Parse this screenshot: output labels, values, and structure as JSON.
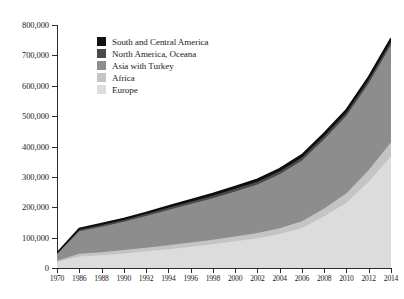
{
  "chart_data": {
    "type": "area",
    "stacked": true,
    "title": "",
    "xlabel": "",
    "ylabel": "",
    "grid": false,
    "legend_position": "inside-top-left",
    "x": [
      1970,
      1986,
      1988,
      1990,
      1992,
      1994,
      1996,
      1998,
      2000,
      2002,
      2004,
      2006,
      2008,
      2010,
      2012,
      2014
    ],
    "xtick_labels": [
      "1970",
      "1986",
      "1988",
      "1990",
      "1992",
      "1994",
      "1996",
      "1998",
      "2000",
      "2002",
      "2004",
      "2006",
      "2008",
      "2010",
      "2012",
      "2014"
    ],
    "xlim": [
      1970,
      2014
    ],
    "ylim": [
      0,
      800000
    ],
    "ytick_values": [
      0,
      100000,
      200000,
      300000,
      400000,
      500000,
      600000,
      700000,
      800000
    ],
    "ytick_labels": [
      "0",
      "100,000",
      "200,000",
      "300,000",
      "400,000",
      "500,000",
      "600,000",
      "700,000",
      "800,000"
    ],
    "series": [
      {
        "name": "Europe",
        "color": "#dcdcdc",
        "values": [
          20000,
          38000,
          42000,
          48000,
          55000,
          62000,
          70000,
          78000,
          88000,
          98000,
          112000,
          132000,
          170000,
          215000,
          285000,
          368000
        ]
      },
      {
        "name": "Africa",
        "color": "#c4c4c4",
        "values": [
          4000,
          9000,
          10000,
          11000,
          12000,
          13000,
          14000,
          15000,
          16000,
          17000,
          19000,
          22000,
          26000,
          31000,
          38000,
          46000
        ]
      },
      {
        "name": "Asia with Turkey",
        "color": "#8d8d8d",
        "values": [
          22000,
          74000,
          84000,
          93000,
          104000,
          116000,
          127000,
          137000,
          148000,
          160000,
          178000,
          200000,
          228000,
          255000,
          285000,
          320000
        ]
      },
      {
        "name": "North America, Oceana",
        "color": "#4a4a4a",
        "values": [
          2000,
          5000,
          5500,
          6000,
          6500,
          7000,
          7500,
          8000,
          8500,
          9000,
          9500,
          10000,
          10500,
          11000,
          11500,
          12000
        ]
      },
      {
        "name": "South and Central America",
        "color": "#111111",
        "values": [
          2000,
          4000,
          4500,
          5000,
          5500,
          6000,
          6500,
          7000,
          7500,
          8000,
          8500,
          9000,
          9500,
          10000,
          10500,
          11000
        ]
      }
    ],
    "totals": [
      50000,
      130000,
      146000,
      163000,
      183000,
      204000,
      225000,
      245000,
      268000,
      292000,
      327000,
      373000,
      444000,
      522000,
      630000,
      757000
    ]
  },
  "legend": {
    "items": [
      {
        "label": "South and Central America",
        "color": "#111111"
      },
      {
        "label": "North America, Oceana",
        "color": "#4a4a4a"
      },
      {
        "label": "Asia with Turkey",
        "color": "#8d8d8d"
      },
      {
        "label": "Africa",
        "color": "#c4c4c4"
      },
      {
        "label": "Europe",
        "color": "#dcdcdc"
      }
    ]
  }
}
